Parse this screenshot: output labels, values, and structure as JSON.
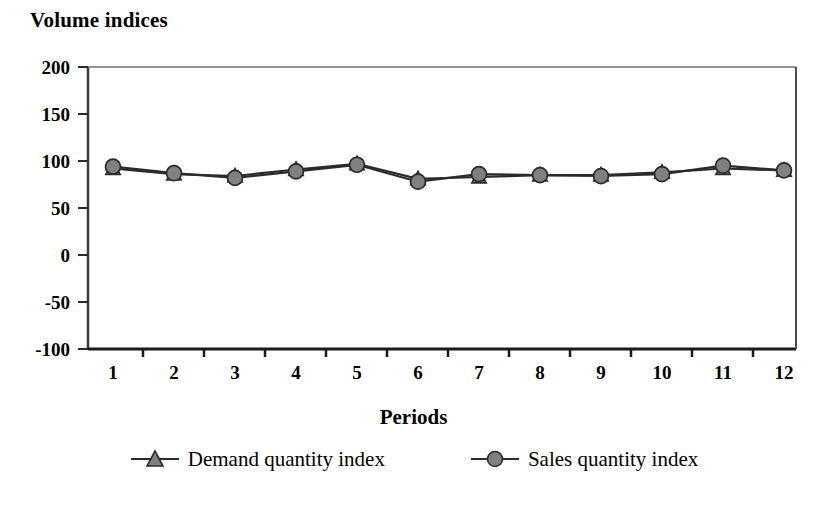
{
  "chart_data": {
    "type": "line",
    "title": "Volume indices",
    "xlabel": "Periods",
    "ylabel": "",
    "categories": [
      "1",
      "2",
      "3",
      "4",
      "5",
      "6",
      "7",
      "8",
      "9",
      "10",
      "11",
      "12"
    ],
    "yticks": [
      "200",
      "150",
      "100",
      "50",
      "0",
      "-50",
      "-100"
    ],
    "ylim": [
      -100,
      200
    ],
    "grid": false,
    "legend_position": "bottom",
    "series": [
      {
        "name": "Demand quantity index",
        "marker": "triangle",
        "color": "#808080",
        "values": [
          92,
          86,
          84,
          91,
          97,
          81,
          83,
          85,
          85,
          88,
          92,
          90
        ]
      },
      {
        "name": "Sales quantity index",
        "marker": "circle",
        "color": "#808080",
        "values": [
          94,
          87,
          82,
          89,
          96,
          78,
          86,
          85,
          84,
          86,
          95,
          90
        ]
      }
    ]
  },
  "axis": {
    "y_tick_0": "200",
    "y_tick_1": "150",
    "y_tick_2": "100",
    "y_tick_3": "50",
    "y_tick_4": "0",
    "y_tick_5": "-50",
    "y_tick_6": "-100"
  }
}
